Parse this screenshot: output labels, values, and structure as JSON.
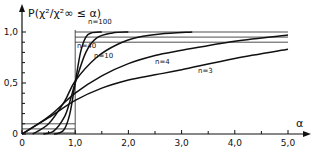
{
  "chart_data": {
    "type": "line",
    "title": "",
    "ylabel": "P(χ²/χ²∞ ≤ α)",
    "xlabel": "α",
    "xlim": [
      0,
      5.4
    ],
    "ylim": [
      0,
      1.05
    ],
    "x_ticks": [
      "0",
      "1,0",
      "2,0",
      "3,0",
      "4,0",
      "5,0"
    ],
    "x_tick_values": [
      0,
      1,
      2,
      3,
      4,
      5
    ],
    "y_ticks": [
      "0",
      "0,5",
      "1,0"
    ],
    "y_tick_values": [
      0,
      0.5,
      1.0
    ],
    "grid": false,
    "reference_lines": {
      "vertical": [
        1.0
      ],
      "horizontal_top": [
        1.0,
        0.95,
        0.9
      ],
      "horizontal_bottom": [
        0.1,
        0.05,
        0.01
      ]
    },
    "series": [
      {
        "name": "n = 100",
        "label": "n=100",
        "x": [
          0.6,
          0.7,
          0.8,
          0.9,
          1.0,
          1.1,
          1.2,
          1.3,
          1.5
        ],
        "y": [
          0.0,
          0.01,
          0.05,
          0.2,
          0.5,
          0.8,
          0.95,
          0.99,
          1.0
        ]
      },
      {
        "name": "n = 40",
        "label": "n=40",
        "x": [
          0.4,
          0.6,
          0.8,
          0.9,
          1.0,
          1.2,
          1.4,
          1.7,
          2.0
        ],
        "y": [
          0.0,
          0.03,
          0.17,
          0.32,
          0.5,
          0.8,
          0.94,
          0.99,
          1.0
        ]
      },
      {
        "name": "n = 10",
        "label": "n=10",
        "x": [
          0.2,
          0.5,
          0.8,
          1.0,
          1.4,
          1.8,
          2.2,
          2.6,
          3.2
        ],
        "y": [
          0.0,
          0.1,
          0.32,
          0.52,
          0.75,
          0.88,
          0.95,
          0.98,
          1.0
        ]
      },
      {
        "name": "n = 4",
        "label": "n=4",
        "x": [
          0.0,
          0.5,
          1.0,
          1.5,
          2.0,
          2.5,
          3.0,
          4.0,
          5.0
        ],
        "y": [
          0.0,
          0.17,
          0.4,
          0.57,
          0.69,
          0.77,
          0.82,
          0.91,
          0.97
        ]
      },
      {
        "name": "n = 3",
        "label": "n=3",
        "x": [
          0.0,
          0.5,
          1.0,
          1.5,
          2.0,
          2.5,
          3.0,
          4.0,
          5.0
        ],
        "y": [
          0.0,
          0.16,
          0.33,
          0.45,
          0.53,
          0.58,
          0.63,
          0.74,
          0.83
        ]
      }
    ]
  }
}
